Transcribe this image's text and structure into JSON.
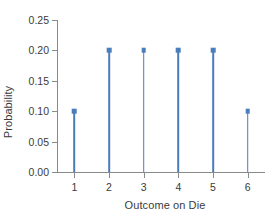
{
  "chart_data": {
    "type": "bar",
    "subtype": "stem-lollipop",
    "title": "",
    "categories": [
      "1",
      "2",
      "3",
      "4",
      "5",
      "6"
    ],
    "values": [
      0.1,
      0.2,
      0.2,
      0.2,
      0.2,
      0.1
    ],
    "xlabel": "Outcome on Die",
    "ylabel": "Probability",
    "ylim": [
      0.0,
      0.25
    ],
    "xlim": [
      0.5,
      6.5
    ],
    "ytick_labels": [
      "0.00",
      "0.05",
      "0.10",
      "0.15",
      "0.20",
      "0.25"
    ],
    "ytick_values": [
      0.0,
      0.05,
      0.1,
      0.15,
      0.2,
      0.25
    ],
    "xtick_labels": [
      "1",
      "2",
      "3",
      "4",
      "5",
      "6"
    ],
    "grid": false,
    "legend": false,
    "series_color": "#4a7ebb",
    "axis_color": "#8a8a8a",
    "text_color": "#3b3b3b",
    "background": "#ffffff"
  }
}
